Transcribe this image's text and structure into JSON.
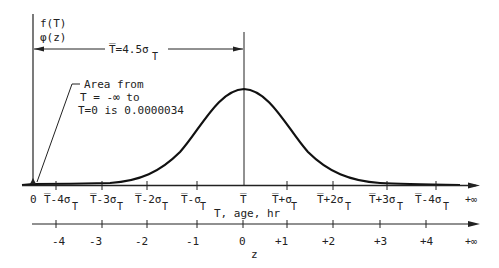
{
  "y_axis": {
    "label_line1": "f(T)",
    "label_line2": "φ(z)"
  },
  "dimension": {
    "label": "T̅=4.5σ",
    "label_sub": "T"
  },
  "annotation": {
    "line1": "Area from",
    "line2": "T = -∞ to",
    "line3": "T=0 is 0.0000034"
  },
  "t_axis": {
    "title": "T, age, hr",
    "ticks": [
      {
        "label": "0",
        "sub": ""
      },
      {
        "label": "T̅-4σ",
        "sub": "T"
      },
      {
        "label": "T̅-3σ",
        "sub": "T"
      },
      {
        "label": "T̅-2σ",
        "sub": "T"
      },
      {
        "label": "T̅-σ",
        "sub": "T"
      },
      {
        "label": "T̅",
        "sub": ""
      },
      {
        "label": "T̅+σ",
        "sub": "T"
      },
      {
        "label": "T̅+2σ",
        "sub": "T"
      },
      {
        "label": "T̅+3σ",
        "sub": "T"
      },
      {
        "label": "T̅-4σ",
        "sub": "T"
      },
      {
        "label": "+∞",
        "sub": ""
      }
    ]
  },
  "z_axis": {
    "title": "z",
    "ticks": [
      "-4",
      "-3",
      "-2",
      "-1",
      "0",
      "+1",
      "+2",
      "+3",
      "+4",
      "+∞"
    ]
  },
  "colors": {
    "ink": "#222222",
    "background": "#ffffff"
  }
}
